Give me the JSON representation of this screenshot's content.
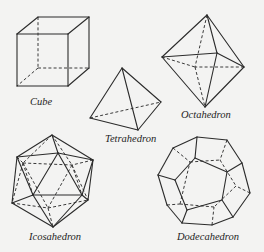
{
  "figure": {
    "background": "#f3f3f2",
    "line_color": "#2b2b2b",
    "solids": [
      {
        "id": "cube",
        "label": "Cube",
        "label_pos": [
          30,
          97
        ],
        "solid_edges": [
          [
            [
              17,
              34
            ],
            [
              68,
              34
            ]
          ],
          [
            [
              68,
              34
            ],
            [
              68,
              86
            ]
          ],
          [
            [
              68,
              86
            ],
            [
              17,
              86
            ]
          ],
          [
            [
              17,
              86
            ],
            [
              17,
              34
            ]
          ],
          [
            [
              17,
              34
            ],
            [
              38,
              17
            ]
          ],
          [
            [
              68,
              34
            ],
            [
              89,
              17
            ]
          ],
          [
            [
              38,
              17
            ],
            [
              89,
              17
            ]
          ],
          [
            [
              89,
              17
            ],
            [
              89,
              68
            ]
          ],
          [
            [
              68,
              86
            ],
            [
              89,
              68
            ]
          ]
        ],
        "hidden_edges": [
          [
            [
              38,
              17
            ],
            [
              38,
              68
            ]
          ],
          [
            [
              38,
              68
            ],
            [
              89,
              68
            ]
          ],
          [
            [
              38,
              68
            ],
            [
              17,
              86
            ]
          ]
        ]
      },
      {
        "id": "tetrahedron",
        "label": "Tetrahedron",
        "label_pos": [
          105,
          134
        ],
        "solid_edges": [
          [
            [
              122,
              68
            ],
            [
              90,
              118
            ]
          ],
          [
            [
              122,
              68
            ],
            [
              138,
              130
            ]
          ],
          [
            [
              122,
              68
            ],
            [
              161,
              102
            ]
          ],
          [
            [
              90,
              118
            ],
            [
              138,
              130
            ]
          ],
          [
            [
              138,
              130
            ],
            [
              161,
              102
            ]
          ]
        ],
        "hidden_edges": [
          [
            [
              90,
              118
            ],
            [
              161,
              102
            ]
          ]
        ]
      },
      {
        "id": "octahedron",
        "label": "Octahedron",
        "label_pos": [
          181,
          110
        ],
        "solid_edges": [
          [
            [
              207,
              15
            ],
            [
              162,
              57
            ]
          ],
          [
            [
              207,
              15
            ],
            [
              217,
              53
            ]
          ],
          [
            [
              207,
              15
            ],
            [
              244,
              67
            ]
          ],
          [
            [
              162,
              57
            ],
            [
              217,
              53
            ]
          ],
          [
            [
              217,
              53
            ],
            [
              244,
              67
            ]
          ],
          [
            [
              162,
              57
            ],
            [
              205,
              107
            ]
          ],
          [
            [
              217,
              53
            ],
            [
              205,
              107
            ]
          ],
          [
            [
              244,
              67
            ],
            [
              205,
              107
            ]
          ]
        ],
        "hidden_edges": [
          [
            [
              207,
              15
            ],
            [
              195,
              67
            ]
          ],
          [
            [
              162,
              57
            ],
            [
              195,
              67
            ]
          ],
          [
            [
              244,
              67
            ],
            [
              195,
              67
            ]
          ],
          [
            [
              195,
              67
            ],
            [
              205,
              107
            ]
          ]
        ]
      },
      {
        "id": "icosahedron",
        "label": "Icosahedron",
        "label_pos": [
          29,
          232
        ],
        "solid_edges": [
          [
            [
              52,
              135
            ],
            [
              17,
              157
            ]
          ],
          [
            [
              52,
              135
            ],
            [
              58,
              153
            ]
          ],
          [
            [
              52,
              135
            ],
            [
              93,
              160
            ]
          ],
          [
            [
              17,
              157
            ],
            [
              58,
              153
            ]
          ],
          [
            [
              58,
              153
            ],
            [
              93,
              160
            ]
          ],
          [
            [
              17,
              157
            ],
            [
              12,
              203
            ]
          ],
          [
            [
              93,
              160
            ],
            [
              88,
              200
            ]
          ],
          [
            [
              17,
              157
            ],
            [
              33,
              195
            ]
          ],
          [
            [
              58,
              153
            ],
            [
              33,
              195
            ]
          ],
          [
            [
              58,
              153
            ],
            [
              82,
              195
            ]
          ],
          [
            [
              93,
              160
            ],
            [
              82,
              195
            ]
          ],
          [
            [
              33,
              195
            ],
            [
              82,
              195
            ]
          ],
          [
            [
              12,
              203
            ],
            [
              33,
              195
            ]
          ],
          [
            [
              82,
              195
            ],
            [
              88,
              200
            ]
          ],
          [
            [
              12,
              203
            ],
            [
              53,
              227
            ]
          ],
          [
            [
              33,
              195
            ],
            [
              53,
              227
            ]
          ],
          [
            [
              82,
              195
            ],
            [
              53,
              227
            ]
          ],
          [
            [
              88,
              200
            ],
            [
              53,
              227
            ]
          ]
        ],
        "hidden_edges": [
          [
            [
              52,
              135
            ],
            [
              23,
              163
            ]
          ],
          [
            [
              52,
              135
            ],
            [
              72,
              165
            ]
          ],
          [
            [
              23,
              163
            ],
            [
              72,
              165
            ]
          ],
          [
            [
              17,
              157
            ],
            [
              23,
              163
            ]
          ],
          [
            [
              93,
              160
            ],
            [
              72,
              165
            ]
          ],
          [
            [
              23,
              163
            ],
            [
              12,
              203
            ]
          ],
          [
            [
              23,
              163
            ],
            [
              48,
              208
            ]
          ],
          [
            [
              72,
              165
            ],
            [
              48,
              208
            ]
          ],
          [
            [
              72,
              165
            ],
            [
              88,
              200
            ]
          ],
          [
            [
              12,
              203
            ],
            [
              48,
              208
            ]
          ],
          [
            [
              48,
              208
            ],
            [
              88,
              200
            ]
          ],
          [
            [
              48,
              208
            ],
            [
              53,
              227
            ]
          ],
          [
            [
              23,
              163
            ],
            [
              33,
              195
            ]
          ],
          [
            [
              72,
              165
            ],
            [
              82,
              195
            ]
          ]
        ]
      },
      {
        "id": "dodecahedron",
        "label": "Dodecahedron",
        "label_pos": [
          177,
          232
        ],
        "solid_edges": [
          [
            [
              197,
              137
            ],
            [
              227,
              140
            ]
          ],
          [
            [
              227,
              140
            ],
            [
              242,
              163
            ]
          ],
          [
            [
              242,
              163
            ],
            [
              250,
              193
            ]
          ],
          [
            [
              250,
              193
            ],
            [
              233,
              217
            ]
          ],
          [
            [
              233,
              217
            ],
            [
              212,
              225
            ]
          ],
          [
            [
              212,
              225
            ],
            [
              182,
              223
            ]
          ],
          [
            [
              182,
              223
            ],
            [
              167,
              205
            ]
          ],
          [
            [
              167,
              205
            ],
            [
              158,
              175
            ]
          ],
          [
            [
              158,
              175
            ],
            [
              173,
              148
            ]
          ],
          [
            [
              173,
              148
            ],
            [
              197,
              137
            ]
          ],
          [
            [
              195,
              158
            ],
            [
              227,
              172
            ]
          ],
          [
            [
              227,
              172
            ],
            [
              222,
              200
            ]
          ],
          [
            [
              222,
              200
            ],
            [
              187,
              210
            ]
          ],
          [
            [
              187,
              210
            ],
            [
              175,
              180
            ]
          ],
          [
            [
              175,
              180
            ],
            [
              195,
              158
            ]
          ],
          [
            [
              197,
              137
            ],
            [
              195,
              158
            ]
          ],
          [
            [
              242,
              163
            ],
            [
              227,
              172
            ]
          ],
          [
            [
              233,
              217
            ],
            [
              222,
              200
            ]
          ],
          [
            [
              182,
              223
            ],
            [
              187,
              210
            ]
          ],
          [
            [
              158,
              175
            ],
            [
              175,
              180
            ]
          ]
        ],
        "hidden_edges": [
          [
            [
              173,
              148
            ],
            [
              190,
              162
            ]
          ],
          [
            [
              227,
              140
            ],
            [
              220,
              160
            ]
          ],
          [
            [
              190,
              162
            ],
            [
              220,
              160
            ]
          ],
          [
            [
              220,
              160
            ],
            [
              236,
              186
            ]
          ],
          [
            [
              250,
              193
            ],
            [
              236,
              186
            ]
          ],
          [
            [
              236,
              186
            ],
            [
              214,
              207
            ]
          ],
          [
            [
              212,
              225
            ],
            [
              214,
              207
            ]
          ],
          [
            [
              214,
              207
            ],
            [
              180,
              204
            ]
          ],
          [
            [
              167,
              205
            ],
            [
              180,
              204
            ]
          ],
          [
            [
              180,
              204
            ],
            [
              190,
              162
            ]
          ]
        ]
      }
    ]
  }
}
